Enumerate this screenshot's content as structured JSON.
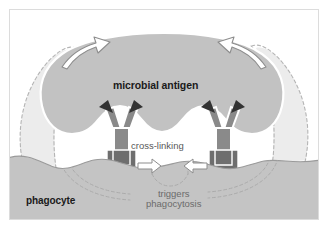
{
  "diagram": {
    "labels": {
      "microbial_antigen": "microbial antigen",
      "cross_linking": "cross-linking",
      "phagocyte": "phagocyte",
      "triggers_line1": "triggers",
      "triggers_line2": "phagocytosis"
    },
    "colors": {
      "background": "#ffffff",
      "frame_border": "#dcdcdc",
      "antigen_fill": "#c2c2c2",
      "antigen_stroke": "#ffffff",
      "phagocyte_fill": "#c4c4c4",
      "phagocyte_stroke": "#9a9a9a",
      "antibody_fill": "#8a8a8a",
      "antibody_stroke": "#ffffff",
      "arrowhead_dark": "#333333",
      "receptor_fill": "#6e6e6e",
      "pseudopod_fill": "#ececec",
      "dashed_stroke": "#b4b4b4",
      "outline_arrow_fill": "#ffffff",
      "outline_arrow_stroke": "#8d8d8d",
      "text_dark": "#1a1a1a",
      "text_gray": "#6b6b6b"
    },
    "elements": [
      {
        "name": "microbial-antigen-blob",
        "role": "large gray mass with three concave pockets along its lower edge"
      },
      {
        "name": "antibody-left",
        "role": "Y-shaped antibody, Fab arms tipped with dark arrowheads bound into antigen pockets"
      },
      {
        "name": "antibody-right",
        "role": "Y-shaped antibody, Fab arms tipped with dark arrowheads bound into antigen pockets"
      },
      {
        "name": "fc-receptor-left",
        "role": "dark U-shaped Fc receptor embedded in phagocyte membrane"
      },
      {
        "name": "fc-receptor-right",
        "role": "dark U-shaped Fc receptor embedded in phagocyte membrane"
      },
      {
        "name": "phagocyte-body",
        "role": "gray cell filling lower region with undulating surface"
      },
      {
        "name": "pseudopod-outline-left",
        "role": "dashed outline showing membrane extending upward to engulf"
      },
      {
        "name": "pseudopod-outline-right",
        "role": "dashed outline showing membrane extending upward to engulf"
      },
      {
        "name": "engulf-arrow-left",
        "role": "white outlined curved arrow pointing up and outward"
      },
      {
        "name": "engulf-arrow-right",
        "role": "white outlined curved arrow pointing up and outward"
      },
      {
        "name": "crosslink-arrow-left",
        "role": "white outlined arrow pointing right"
      },
      {
        "name": "crosslink-arrow-right",
        "role": "white outlined arrow pointing left"
      }
    ]
  }
}
